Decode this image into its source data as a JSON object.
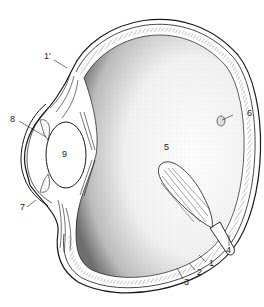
{
  "diagram": {
    "type": "anatomical-cross-section",
    "colors": {
      "ink": "#1a1a1a",
      "background": "#ffffff",
      "stipple": "#555555"
    },
    "labels": [
      {
        "id": "1prime",
        "text": "1'",
        "x": 47,
        "y": 56
      },
      {
        "id": "1",
        "text": "1",
        "x": 209,
        "y": 264
      },
      {
        "id": "2",
        "text": "2",
        "x": 197,
        "y": 272
      },
      {
        "id": "3",
        "text": "3",
        "x": 184,
        "y": 282
      },
      {
        "id": "4",
        "text": "4",
        "x": 226,
        "y": 249
      },
      {
        "id": "5",
        "text": "5",
        "x": 164,
        "y": 148
      },
      {
        "id": "6",
        "text": "6",
        "x": 248,
        "y": 112
      },
      {
        "id": "7",
        "text": "7",
        "x": 21,
        "y": 207
      },
      {
        "id": "8",
        "text": "8",
        "x": 11,
        "y": 117
      },
      {
        "id": "9",
        "text": "9",
        "x": 63,
        "y": 152
      }
    ]
  }
}
